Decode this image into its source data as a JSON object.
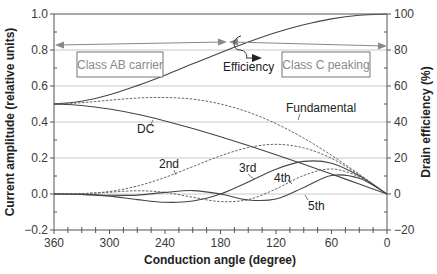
{
  "chart_data": {
    "type": "line",
    "title": "",
    "xlabel": "Conduction angle (degree)",
    "ylabel": "Current amplitude (relative units)",
    "y2label": "Drain efficiency (%)",
    "xlim": [
      360,
      0
    ],
    "ylim": [
      -0.2,
      1.0
    ],
    "y2lim": [
      -20,
      100
    ],
    "xticks": [
      360,
      300,
      240,
      180,
      120,
      60,
      0
    ],
    "xtick_labels": [
      "360",
      "300",
      "240",
      "180",
      "120",
      "60",
      "0"
    ],
    "yticks": [
      -0.2,
      0.0,
      0.2,
      0.4,
      0.6,
      0.8,
      1.0
    ],
    "ytick_labels": [
      "−0.2",
      "0.0",
      "0.2",
      "0.4",
      "0.6",
      "0.8",
      "1.0"
    ],
    "y2ticks": [
      -20,
      0,
      20,
      40,
      60,
      80,
      100
    ],
    "y2tick_labels": [
      "−20",
      "0",
      "20",
      "40",
      "60",
      "80",
      "100"
    ],
    "grid": "horizontal",
    "x": [
      360,
      330,
      300,
      270,
      240,
      210,
      180,
      150,
      120,
      90,
      60,
      30,
      0
    ],
    "series": [
      {
        "name": "Efficiency",
        "axis": "right",
        "style": "solid",
        "values": [
          50.0,
          51.5,
          55.1,
          60.2,
          66.0,
          72.3,
          78.5,
          84.4,
          89.7,
          94.0,
          97.3,
          99.3,
          100.0
        ]
      },
      {
        "name": "DC",
        "axis": "left",
        "style": "solid",
        "values": [
          0.5,
          0.492,
          0.472,
          0.443,
          0.406,
          0.364,
          0.318,
          0.269,
          0.218,
          0.165,
          0.111,
          0.055,
          0.0
        ]
      },
      {
        "name": "Fundamental",
        "axis": "left",
        "style": "dashed",
        "values": [
          0.5,
          0.507,
          0.521,
          0.533,
          0.536,
          0.527,
          0.5,
          0.455,
          0.391,
          0.31,
          0.215,
          0.11,
          0.0
        ]
      },
      {
        "name": "2nd",
        "axis": "left",
        "style": "dashed",
        "values": [
          0.0,
          0.002,
          0.014,
          0.044,
          0.092,
          0.152,
          0.212,
          0.258,
          0.276,
          0.256,
          0.198,
          0.106,
          0.0
        ]
      },
      {
        "name": "3rd",
        "axis": "left",
        "style": "solid",
        "values": [
          0.0,
          -0.002,
          -0.012,
          -0.031,
          -0.046,
          -0.039,
          0.0,
          0.067,
          0.138,
          0.181,
          0.171,
          0.101,
          0.0
        ]
      },
      {
        "name": "4th",
        "axis": "left",
        "style": "dashed",
        "values": [
          0.0,
          0.002,
          0.01,
          0.018,
          0.009,
          -0.018,
          -0.042,
          -0.031,
          0.028,
          0.103,
          0.139,
          0.095,
          0.0
        ]
      },
      {
        "name": "5th",
        "axis": "left",
        "style": "solid",
        "values": [
          0.0,
          -0.002,
          -0.007,
          -0.006,
          0.009,
          0.019,
          0.0,
          -0.033,
          -0.028,
          0.036,
          0.103,
          0.087,
          0.0
        ]
      }
    ],
    "annotations": {
      "class_ab_box": "Class AB carrier",
      "class_c_box": "Class C peaking",
      "efficiency_label": "Efficiency",
      "fundamental_label": "Fundamental",
      "dc_label": "DC",
      "second_label": "2nd",
      "third_label": "3rd",
      "fourth_label": "4th",
      "fifth_label": "5th"
    }
  }
}
